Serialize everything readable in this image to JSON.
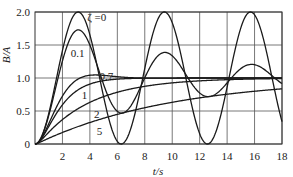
{
  "chart_data": {
    "type": "line",
    "title": "",
    "xlabel": "t/s",
    "ylabel": "B/A",
    "xlim": [
      0,
      18
    ],
    "ylim": [
      0,
      2.0
    ],
    "grid": true,
    "legend": "inline curve labels",
    "x_ticks": [
      "2",
      "4",
      "6",
      "8",
      "10",
      "12",
      "14",
      "16",
      "18"
    ],
    "y_ticks": [
      "0",
      "0.5",
      "1.0",
      "1.5",
      "2.0"
    ],
    "x_tick_values": [
      2,
      4,
      6,
      8,
      10,
      12,
      14,
      16,
      18
    ],
    "y_tick_values": [
      0,
      0.5,
      1.0,
      1.5,
      2.0
    ],
    "x": [
      0,
      1,
      2,
      3,
      4,
      5,
      6,
      7,
      8,
      9,
      10,
      11,
      12,
      13,
      14,
      15,
      16,
      17,
      18
    ],
    "series": [
      {
        "name": "ζ =0",
        "zeta": 0,
        "label": "ζ =0",
        "label_pos": [
          3.8,
          1.93
        ],
        "values": [
          0,
          0.46,
          1.42,
          1.99,
          1.65,
          0.72,
          0.04,
          0.25,
          1.15,
          1.91,
          1.84,
          1.0,
          0.16,
          0.09,
          0.86,
          1.76,
          1.96,
          1.28,
          0.34
        ]
      },
      {
        "name": "0.1",
        "zeta": 0.1,
        "label": "0.1",
        "label_pos": [
          2.6,
          1.38
        ],
        "values": [
          0,
          0.45,
          1.35,
          1.72,
          1.35,
          0.77,
          0.53,
          0.79,
          1.21,
          1.37,
          1.16,
          0.87,
          0.77,
          0.92,
          1.12,
          1.18,
          1.05,
          0.92,
          0.91
        ]
      },
      {
        "name": "0.7",
        "zeta": 0.7,
        "label": "0.7",
        "label_pos": [
          4.7,
          1.03
        ],
        "values": [
          0,
          0.37,
          0.8,
          1.0,
          1.04,
          1.03,
          1.01,
          1.0,
          1.0,
          1.0,
          1.0,
          1.0,
          1.0,
          1.0,
          1.0,
          1.0,
          1.0,
          1.0,
          1.0
        ]
      },
      {
        "name": "1",
        "zeta": 1,
        "label": "1",
        "label_pos": [
          3.4,
          0.74
        ],
        "values": [
          0,
          0.26,
          0.59,
          0.8,
          0.91,
          0.96,
          0.98,
          0.99,
          1.0,
          1.0,
          1.0,
          1.0,
          1.0,
          1.0,
          1.0,
          1.0,
          1.0,
          1.0,
          1.0
        ]
      },
      {
        "name": "2",
        "zeta": 2,
        "label": "2",
        "label_pos": [
          4.3,
          0.45
        ],
        "values": [
          0,
          0.17,
          0.37,
          0.51,
          0.63,
          0.71,
          0.78,
          0.83,
          0.87,
          0.9,
          0.92,
          0.94,
          0.95,
          0.96,
          0.97,
          0.98,
          0.98,
          0.99,
          0.99
        ]
      },
      {
        "name": "5",
        "zeta": 5,
        "label": "5",
        "label_pos": [
          4.5,
          0.19
        ],
        "values": [
          0,
          0.1,
          0.18,
          0.26,
          0.33,
          0.39,
          0.45,
          0.5,
          0.55,
          0.59,
          0.63,
          0.67,
          0.7,
          0.73,
          0.75,
          0.78,
          0.8,
          0.82,
          0.83
        ]
      }
    ]
  },
  "labels": {
    "xlabel": "t/s",
    "ylabel": "B/A"
  }
}
